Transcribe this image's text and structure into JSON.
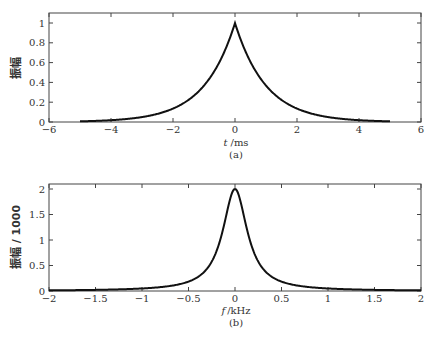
{
  "chart_data": [
    {
      "type": "line",
      "panel": "(a)",
      "title": "",
      "xlabel": "t /ms",
      "ylabel": "振幅",
      "xlim": [
        -6,
        6
      ],
      "ylim": [
        0,
        1.1
      ],
      "xticks": [
        -6,
        -4,
        -2,
        0,
        2,
        4,
        6
      ],
      "yticks": [
        0,
        0.2,
        0.4,
        0.6,
        0.8,
        1
      ],
      "grid": false,
      "series": [
        {
          "name": "exp(-|t|)",
          "x": [
            -5,
            -4,
            -3,
            -2,
            -1.5,
            -1,
            -0.5,
            0,
            0.5,
            1,
            1.5,
            2,
            3,
            4,
            5
          ],
          "values": [
            0.007,
            0.018,
            0.05,
            0.135,
            0.223,
            0.368,
            0.607,
            1.0,
            0.607,
            0.368,
            0.223,
            0.135,
            0.05,
            0.018,
            0.007
          ]
        }
      ]
    },
    {
      "type": "line",
      "panel": "(b)",
      "title": "",
      "xlabel": "f /kHz",
      "ylabel": "振幅 / 1000",
      "xlim": [
        -2,
        2
      ],
      "ylim": [
        0,
        2.1
      ],
      "xticks": [
        -2,
        -1.5,
        -1,
        -0.5,
        0,
        0.5,
        1,
        1.5,
        2
      ],
      "yticks": [
        0,
        0.5,
        1,
        1.5,
        2
      ],
      "grid": false,
      "series": [
        {
          "name": "spectrum",
          "x": [
            -2,
            -1.5,
            -1,
            -0.5,
            -0.3,
            -0.2,
            -0.1,
            0,
            0.1,
            0.2,
            0.3,
            0.5,
            1,
            1.5,
            2
          ],
          "values": [
            0.013,
            0.022,
            0.049,
            0.184,
            0.44,
            0.78,
            1.43,
            2.0,
            1.43,
            0.78,
            0.44,
            0.184,
            0.049,
            0.022,
            0.013
          ]
        }
      ]
    }
  ],
  "panels": {
    "a": {
      "caption": "(a)",
      "xlabel_var": "t",
      "xlabel_unit": "/ms",
      "ylabel": "振幅",
      "xticks": [
        "−6",
        "−4",
        "−2",
        "0",
        "2",
        "4",
        "6"
      ],
      "yticks": [
        "0",
        "0.2",
        "0.4",
        "0.6",
        "0.8",
        "1"
      ]
    },
    "b": {
      "caption": "(b)",
      "xlabel_var": "f",
      "xlabel_unit": "/kHz",
      "ylabel": "振幅 / 1000",
      "xticks": [
        "−2",
        "−1.5",
        "−1",
        "−0.5",
        "0",
        "0.5",
        "1",
        "1.5",
        "2"
      ],
      "yticks": [
        "0",
        "0.5",
        "1",
        "1.5",
        "2"
      ]
    }
  }
}
